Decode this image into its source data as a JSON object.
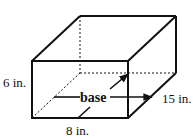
{
  "diagram": {
    "type": "rectangular-prism",
    "labels": {
      "height": "6 in.",
      "depth": "15 in.",
      "width": "8 in.",
      "base": "base"
    },
    "colors": {
      "stroke": "#111111",
      "background": "#ffffff"
    }
  }
}
